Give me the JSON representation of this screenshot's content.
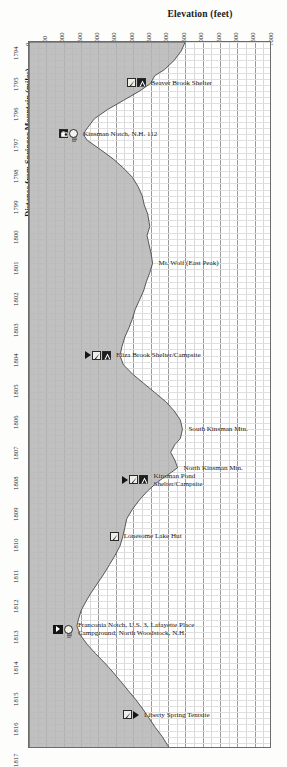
{
  "chart_data": {
    "type": "area",
    "title": "Elevation (feet)",
    "xlabel": "Elevation (feet)",
    "ylabel": "Distance from Springer Mountain (miles)",
    "orientation": "vertical-profile",
    "grid": true,
    "xlim": [
      0,
      7000
    ],
    "ylim": [
      1794,
      1817
    ],
    "xticks": [
      0,
      500,
      1000,
      1500,
      2000,
      2500,
      3000,
      3500,
      4000,
      4500,
      5000,
      5500,
      6000,
      6500,
      7000
    ],
    "yticks": [
      1794,
      1795,
      1796,
      1797,
      1798,
      1799,
      1800,
      1801,
      1802,
      1803,
      1804,
      1805,
      1806,
      1807,
      1808,
      1809,
      1810,
      1811,
      1812,
      1813,
      1814,
      1815,
      1816,
      1817
    ],
    "series": [
      {
        "name": "Appalachian Trail elevation profile",
        "x_label": "mile",
        "y_label": "elevation_ft",
        "points": [
          [
            1794.0,
            4500
          ],
          [
            1794.3,
            4380
          ],
          [
            1794.6,
            4180
          ],
          [
            1794.9,
            3900
          ],
          [
            1795.1,
            3620
          ],
          [
            1795.35,
            3500
          ],
          [
            1795.6,
            3180
          ],
          [
            1795.9,
            2720
          ],
          [
            1796.2,
            2260
          ],
          [
            1796.5,
            1880
          ],
          [
            1796.8,
            1680
          ],
          [
            1797.0,
            1560
          ],
          [
            1797.2,
            1680
          ],
          [
            1797.5,
            2060
          ],
          [
            1797.8,
            2420
          ],
          [
            1798.1,
            2720
          ],
          [
            1798.4,
            2980
          ],
          [
            1798.7,
            3140
          ],
          [
            1799.0,
            3260
          ],
          [
            1799.3,
            3320
          ],
          [
            1799.6,
            3420
          ],
          [
            1800.0,
            3480
          ],
          [
            1800.3,
            3400
          ],
          [
            1800.6,
            3460
          ],
          [
            1800.9,
            3520
          ],
          [
            1801.2,
            3560
          ],
          [
            1801.5,
            3480
          ],
          [
            1801.8,
            3380
          ],
          [
            1802.1,
            3300
          ],
          [
            1802.4,
            3180
          ],
          [
            1802.7,
            3060
          ],
          [
            1803.0,
            2980
          ],
          [
            1803.3,
            2880
          ],
          [
            1803.6,
            2760
          ],
          [
            1803.9,
            2680
          ],
          [
            1804.2,
            2620
          ],
          [
            1804.5,
            2720
          ],
          [
            1804.8,
            2980
          ],
          [
            1805.1,
            3300
          ],
          [
            1805.4,
            3620
          ],
          [
            1805.7,
            3940
          ],
          [
            1806.0,
            4180
          ],
          [
            1806.3,
            4360
          ],
          [
            1806.6,
            4420
          ],
          [
            1806.9,
            4360
          ],
          [
            1807.1,
            4200
          ],
          [
            1807.35,
            4080
          ],
          [
            1807.6,
            4200
          ],
          [
            1807.85,
            4280
          ],
          [
            1808.0,
            4100
          ],
          [
            1808.3,
            3720
          ],
          [
            1808.6,
            3420
          ],
          [
            1808.9,
            3180
          ],
          [
            1809.2,
            2980
          ],
          [
            1809.5,
            2820
          ],
          [
            1809.8,
            2760
          ],
          [
            1810.1,
            2700
          ],
          [
            1810.4,
            2620
          ],
          [
            1810.7,
            2480
          ],
          [
            1811.0,
            2320
          ],
          [
            1811.3,
            2160
          ],
          [
            1811.6,
            1980
          ],
          [
            1811.9,
            1800
          ],
          [
            1812.2,
            1640
          ],
          [
            1812.5,
            1500
          ],
          [
            1812.8,
            1420
          ],
          [
            1813.0,
            1380
          ],
          [
            1813.3,
            1480
          ],
          [
            1813.6,
            1680
          ],
          [
            1813.9,
            1920
          ],
          [
            1814.2,
            2180
          ],
          [
            1814.5,
            2420
          ],
          [
            1814.8,
            2640
          ],
          [
            1815.1,
            2860
          ],
          [
            1815.4,
            3080
          ],
          [
            1815.7,
            3280
          ],
          [
            1816.0,
            3460
          ],
          [
            1816.3,
            3640
          ],
          [
            1816.6,
            3840
          ],
          [
            1817.0,
            4060
          ]
        ]
      }
    ],
    "annotations": [
      {
        "id": "beaver-brook-shelter",
        "label": "Beaver Brook Shelter",
        "mile": 1795.35,
        "elevation_ft": 3500,
        "icons": [
          "water-icon",
          "shelter-icon"
        ]
      },
      {
        "id": "kinsman-notch",
        "label": "Kinsman Notch, N.H. 112",
        "mile": 1797.0,
        "elevation_ft": 1560,
        "icons": [
          "parking-icon",
          "info-icon"
        ]
      },
      {
        "id": "mt-wolf-east-peak",
        "label": "Mt. Wolf (East Peak)",
        "mile": 1801.2,
        "elevation_ft": 3560,
        "icons": []
      },
      {
        "id": "eliza-brook-shelter-campsite",
        "label": "Eliza Brook Shelter/Campsite",
        "mile": 1804.2,
        "elevation_ft": 2620,
        "icons": [
          "arrow-icon",
          "water-icon",
          "shelter-icon"
        ]
      },
      {
        "id": "south-kinsman-mtn",
        "label": "South Kinsman Mtn.",
        "mile": 1806.6,
        "elevation_ft": 4420,
        "icons": []
      },
      {
        "id": "north-kinsman-mtn",
        "label": "North Kinsman Mtn.",
        "mile": 1807.85,
        "elevation_ft": 4280,
        "icons": []
      },
      {
        "id": "kinsman-pond-shelter-campsite",
        "label": "Kinsman Pond",
        "label_line2": "Shelter/Campsite",
        "mile": 1808.15,
        "elevation_ft": 3700,
        "icons": [
          "arrow-icon",
          "water-icon",
          "shelter-icon"
        ]
      },
      {
        "id": "lonesome-lake-hut",
        "label": "Lonesome Lake Hut",
        "mile": 1810.1,
        "elevation_ft": 2700,
        "icons": [
          "water-icon"
        ]
      },
      {
        "id": "franconia-notch",
        "label": "Franconia Notch, U.S. 3, Lafayette Place",
        "label_line2": "Campground; North Woodstock, N.H.",
        "mile": 1813.0,
        "elevation_ft": 1380,
        "icons": [
          "arrow-box-icon",
          "info-icon"
        ]
      },
      {
        "id": "liberty-spring-tentsite",
        "label": "Liberty Spring Tentsite",
        "mile": 1815.9,
        "elevation_ft": 3400,
        "icons": [
          "water-icon",
          "arrow-icon"
        ]
      }
    ],
    "colors": {
      "terrain_fill": "#b5b5b5",
      "profile_line": "#4a4a4a",
      "grid_major": "#9a9a9a",
      "grid_minor": "#dcdcdc",
      "text": "#141414",
      "background": "#ffffff"
    }
  }
}
